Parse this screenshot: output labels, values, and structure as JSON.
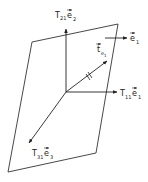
{
  "diagram": {
    "type": "stress-vector-on-plane",
    "plane": {
      "corners": [
        [
          32,
          42
        ],
        [
          118,
          24
        ],
        [
          96,
          153
        ],
        [
          8,
          172
        ]
      ],
      "stroke": "#333333"
    },
    "origin": [
      66,
      92
    ],
    "vectors": [
      {
        "id": "t21",
        "from": [
          66,
          92
        ],
        "to": [
          66,
          28
        ],
        "label_main": "T",
        "label_sub": "21",
        "label_vec": "e",
        "label_vec_sub": "2",
        "label_pos": [
          55,
          17
        ]
      },
      {
        "id": "t11",
        "from": [
          66,
          92
        ],
        "to": [
          117,
          92
        ],
        "label_main": "T",
        "label_sub": "11",
        "label_vec": "e",
        "label_vec_sub": "1",
        "label_pos": [
          120,
          96
        ]
      },
      {
        "id": "t31",
        "from": [
          66,
          92
        ],
        "to": [
          29,
          143
        ],
        "label_main": "T",
        "label_sub": "31",
        "label_vec": "e",
        "label_vec_sub": "3",
        "label_pos": [
          32,
          155
        ]
      },
      {
        "id": "te1",
        "from": [
          66,
          92
        ],
        "to": [
          107,
          61
        ],
        "label_main": "t",
        "label_sub": "e",
        "label_sub2": "1",
        "label_pos": [
          96,
          52
        ]
      },
      {
        "id": "e1",
        "from": [
          105,
          38
        ],
        "to": [
          127,
          38
        ],
        "label_main": "e",
        "label_sub": "1",
        "label_pos": [
          131,
          41
        ]
      }
    ]
  },
  "labels": {
    "t21_main": "T",
    "t21_sub": "21",
    "t21_vec": "e",
    "t21_vec_sub": "2",
    "t11_main": "T",
    "t11_sub": "11",
    "t11_vec": "e",
    "t11_vec_sub": "1",
    "t31_main": "T",
    "t31_sub": "31",
    "t31_vec": "e",
    "t31_vec_sub": "3",
    "te1_main": "t",
    "te1_sub": "e",
    "te1_sub2": "1",
    "e1_main": "e",
    "e1_sub": "1"
  }
}
